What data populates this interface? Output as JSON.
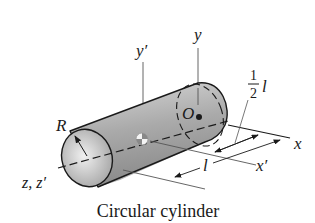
{
  "figure": {
    "caption": "Circular cylinder",
    "labels": {
      "y": "y",
      "y_prime": "y′",
      "origin": "O",
      "R": "R",
      "z": "z, z′",
      "x": "x",
      "x_prime": "x′",
      "half_num": "1",
      "half_den": "2",
      "half_l": "l",
      "l": "l"
    },
    "colors": {
      "stroke": "#1a1a1a",
      "fill_light": "#e8e8e8",
      "fill_dark": "#8a8a8a",
      "background": "#ffffff"
    }
  }
}
